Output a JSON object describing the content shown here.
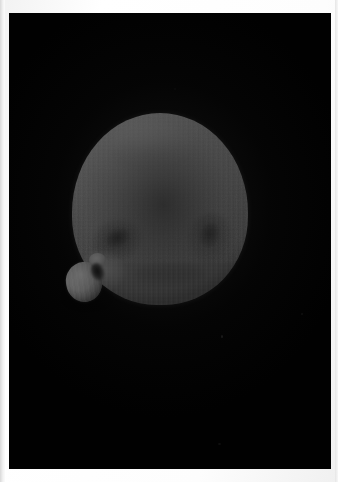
{
  "image": {
    "kind": "photograph",
    "subject": "celestial-body",
    "caption": "Grayscale telescopic photograph of a round planetary body with a small attached lobe at the lower left, shown against a black sky background.",
    "orientation": "portrait",
    "width_px": 338,
    "height_px": 482
  },
  "sheet": {
    "name": "photographic print",
    "border_color": "#fdfdfd",
    "border_top_px": 13,
    "border_left_px": 9,
    "border_right_px": 7,
    "border_bottom_px": 13
  },
  "frame": {
    "name": "exposed photo field",
    "background_color": "#010101",
    "left_px": 9,
    "top_px": 13,
    "width_px": 322,
    "height_px": 456
  },
  "subject": {
    "main_body": {
      "name": "main spherical body",
      "shape": "sphere",
      "center_x_px": 160,
      "center_y_px": 209,
      "width_px": 176,
      "height_px": 192,
      "brightest_tone": "#cfcfcf",
      "mid_tone": "#a3a3a3",
      "terminator_tone": "#6f6f6f",
      "illumination_direction": "upper-left",
      "texture": "vertical raster scanlines"
    },
    "small_lobe": {
      "name": "attached lobe",
      "shape": "irregular rounded",
      "center_x_px": 84,
      "center_y_px": 282,
      "width_px": 36,
      "height_px": 40,
      "brightest_tone": "#d6d6d6",
      "position": "lower-left limb"
    },
    "markings": [
      {
        "name": "left dark patch",
        "type": "albedo-feature",
        "center_x_px": 118,
        "center_y_px": 240,
        "tone": "dark"
      },
      {
        "name": "right crater",
        "type": "crater",
        "center_x_px": 212,
        "center_y_px": 239,
        "tone": "dark"
      },
      {
        "name": "lower mottling",
        "type": "surface-mottling",
        "center_x_px": 170,
        "center_y_px": 275,
        "tone": "faint-dark"
      },
      {
        "name": "notch shadow",
        "type": "shadow",
        "center_x_px": 97,
        "center_y_px": 272,
        "tone": "black"
      }
    ]
  },
  "background": {
    "name": "night sky",
    "color": "#010101",
    "visible_stars": 0,
    "dust_specks": 5
  },
  "palette": {
    "sky": "#010101",
    "paper": "#fdfdfd",
    "highlight": "#d6d6d6",
    "midtone": "#a3a3a3",
    "shadow": "#6f6f6f"
  }
}
